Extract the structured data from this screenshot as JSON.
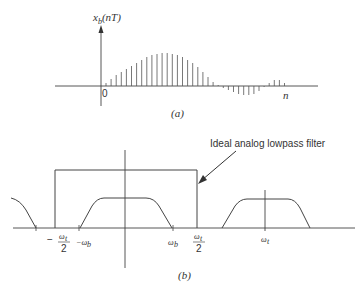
{
  "figure_a": {
    "caption": "(a)",
    "y_axis_label": "x_b(nT)",
    "y_axis_label_main": "x",
    "y_axis_label_sub": "b",
    "y_axis_label_arg": "(nT)",
    "x_axis_label": "n",
    "origin_label": "0",
    "samples": [
      3,
      7,
      11,
      14,
      17,
      20,
      23,
      26,
      29,
      31,
      32,
      33,
      33,
      32,
      31,
      29,
      26,
      23,
      19,
      14,
      9,
      4,
      1,
      -2,
      -4,
      -6,
      -8,
      -9,
      -9,
      -8,
      -5,
      -1,
      3,
      6,
      6,
      3,
      0
    ]
  },
  "figure_b": {
    "caption": "(b)",
    "annotation": "Ideal analog lowpass filter",
    "tick_labels": {
      "neg_ws_half": {
        "sign": "−",
        "num": "ω",
        "num_sub": "t",
        "den": "2"
      },
      "neg_wb": {
        "text": "−ω",
        "sub": "b"
      },
      "wb": {
        "text": "ω",
        "sub": "b"
      },
      "ws_half": {
        "num": "ω",
        "num_sub": "t",
        "den": "2"
      },
      "ws": {
        "text": "ω",
        "sub": "t"
      }
    }
  },
  "colors": {
    "ink": "#333333",
    "stem": "#555555",
    "background": "#ffffff"
  }
}
